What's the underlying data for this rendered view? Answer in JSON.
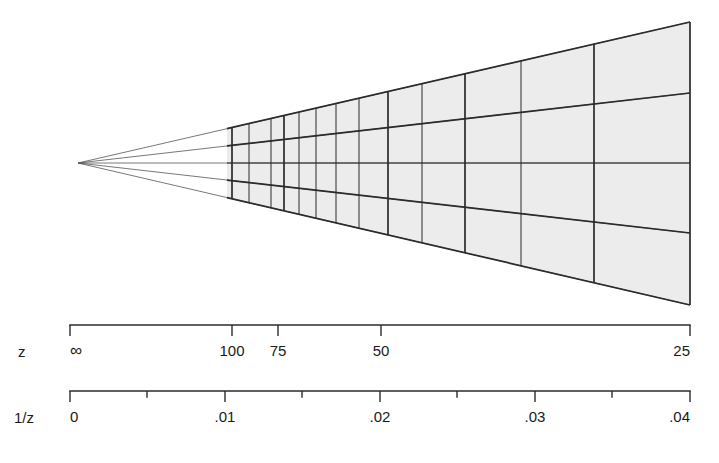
{
  "figure": {
    "title": "",
    "background_color": "#ffffff",
    "line_color": "#2b2b2b",
    "fill_color": "#ececec",
    "ray_color": "#555555"
  },
  "chart_data": {
    "type": "diagram",
    "title": "",
    "subtitle": "",
    "xlabel": "",
    "ylabel": "",
    "grid": true,
    "legend": null,
    "vanishing_point": {
      "x": 78,
      "y": 163
    },
    "geometry": {
      "near_plane_x": 690,
      "near_plane_top_y": 22,
      "near_plane_bottom_y": 305,
      "fill_start_x": 227,
      "horizontal_ray_fractions": [
        0.0,
        0.25,
        0.5,
        0.75,
        1.0
      ]
    },
    "axes": [
      {
        "name": "z",
        "label": "z",
        "orientation": "horizontal",
        "scale": "reciprocal",
        "x_start": 70,
        "x_end": 690,
        "ticks": [
          {
            "value": "∞",
            "label": "∞",
            "x": 70,
            "major": true
          },
          {
            "value": "100",
            "label": "100",
            "x": 232,
            "major": true
          },
          {
            "value": "75",
            "label": "75",
            "x": 278,
            "major": true
          },
          {
            "value": "50",
            "label": "50",
            "x": 381,
            "major": true
          },
          {
            "value": "25",
            "label": "25",
            "x": 690,
            "major": true
          }
        ]
      },
      {
        "name": "1/z",
        "label": "1/z",
        "orientation": "horizontal",
        "scale": "linear",
        "x_start": 70,
        "x_end": 690,
        "range": [
          0,
          0.04
        ],
        "ticks": [
          {
            "value": "0",
            "label": "0",
            "x": 70,
            "major": true
          },
          {
            "value": "0.005",
            "label": "",
            "x": 147,
            "major": false
          },
          {
            "value": ".01",
            "label": ".01",
            "x": 225,
            "major": true
          },
          {
            "value": "0.015",
            "label": "",
            "x": 302,
            "major": false
          },
          {
            "value": ".02",
            "label": ".02",
            "x": 380,
            "major": true
          },
          {
            "value": "0.025",
            "label": "",
            "x": 457,
            "major": false
          },
          {
            "value": ".03",
            "label": ".03",
            "x": 535,
            "major": true
          },
          {
            "value": "0.035",
            "label": "",
            "x": 612,
            "major": false
          },
          {
            "value": ".04",
            "label": ".04",
            "x": 690,
            "major": true
          }
        ]
      }
    ],
    "grid_columns": [
      {
        "z": "∞",
        "inv_z": 0.0,
        "x": 78,
        "kind": "vanishing"
      },
      {
        "z": "200",
        "inv_z": 0.005,
        "x": 155,
        "kind": "implied"
      },
      {
        "z": "140",
        "inv_z": 0.0071,
        "x": 188,
        "kind": "implied"
      },
      {
        "z": "110",
        "inv_z": 0.0091,
        "x": 219,
        "kind": "minor"
      },
      {
        "z": "100",
        "inv_z": 0.01,
        "x": 232,
        "kind": "major"
      },
      {
        "z": "90",
        "inv_z": 0.0111,
        "x": 249,
        "kind": "minor"
      },
      {
        "z": "80",
        "inv_z": 0.0125,
        "x": 271,
        "kind": "minor"
      },
      {
        "z": "75",
        "inv_z": 0.0133,
        "x": 284,
        "kind": "major"
      },
      {
        "z": "70",
        "inv_z": 0.0143,
        "x": 299,
        "kind": "minor"
      },
      {
        "z": "65",
        "inv_z": 0.0154,
        "x": 316,
        "kind": "minor"
      },
      {
        "z": "60",
        "inv_z": 0.0167,
        "x": 336,
        "kind": "minor"
      },
      {
        "z": "55",
        "inv_z": 0.0182,
        "x": 359,
        "kind": "minor"
      },
      {
        "z": "50",
        "inv_z": 0.02,
        "x": 388,
        "kind": "major"
      },
      {
        "z": "45",
        "inv_z": 0.0222,
        "x": 422,
        "kind": "minor"
      },
      {
        "z": "40",
        "inv_z": 0.025,
        "x": 465,
        "kind": "major"
      },
      {
        "z": "35",
        "inv_z": 0.0286,
        "x": 521,
        "kind": "minor"
      },
      {
        "z": "30",
        "inv_z": 0.0333,
        "x": 594,
        "kind": "major"
      },
      {
        "z": "25",
        "inv_z": 0.04,
        "x": 690,
        "kind": "major"
      }
    ],
    "grid_rows": [
      {
        "index": 0,
        "fraction": 0.0,
        "near_y": 22,
        "label": "top edge"
      },
      {
        "index": 1,
        "fraction": 0.25,
        "near_y": 93,
        "label": "upper"
      },
      {
        "index": 2,
        "fraction": 0.5,
        "near_y": 163,
        "label": "center axis"
      },
      {
        "index": 3,
        "fraction": 0.75,
        "near_y": 233,
        "label": "lower"
      },
      {
        "index": 4,
        "fraction": 1.0,
        "near_y": 305,
        "label": "bottom edge"
      }
    ]
  }
}
